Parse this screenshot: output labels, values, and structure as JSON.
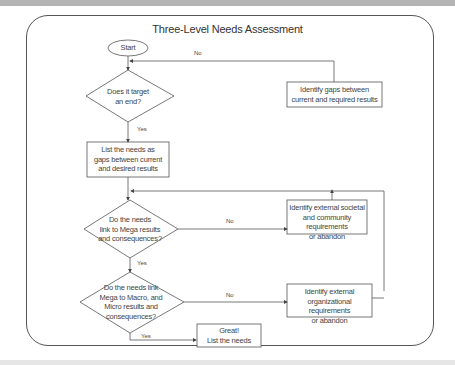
{
  "diagram": {
    "title": "Three-Level Needs Assessment",
    "nodes": {
      "start": {
        "label": "Start",
        "shape": "oval"
      },
      "decision1": {
        "label_lines": [
          "Does it target",
          "an end?"
        ],
        "shape": "diamond"
      },
      "identify_gaps": {
        "label_lines": [
          "Identify gaps between",
          "current and required results"
        ],
        "shape": "rect"
      },
      "list_needs": {
        "label_lines": [
          "List the needs as",
          "gaps between current",
          "and desired results"
        ],
        "shape": "rect"
      },
      "decision2": {
        "label_lines": [
          "Do the needs",
          "link to Mega results",
          "and consequences?"
        ],
        "shape": "diamond"
      },
      "identify_societal": {
        "label_lines": [
          "Identify external societal",
          "and community requirements",
          "or abandon"
        ],
        "shape": "rect"
      },
      "decision3": {
        "label_lines": [
          "Do the needs link",
          "Mega to Macro, and",
          "Micro results and",
          "consequences?"
        ],
        "shape": "diamond"
      },
      "identify_org": {
        "label_lines": [
          "Identify external",
          "organizational requirements",
          "or abandon"
        ],
        "shape": "rect"
      },
      "great": {
        "label_lines": [
          "Great!",
          "List the needs"
        ],
        "shape": "rect"
      }
    },
    "edge_labels": {
      "d1_no": "No",
      "d1_yes": "Yes",
      "d2_no": "No",
      "d2_yes": "Yes",
      "d3_no": "No",
      "d3_yes": "Yes"
    },
    "colors": {
      "line": "#555555",
      "text": "#333333",
      "top_band": "#b4b4b4"
    }
  }
}
